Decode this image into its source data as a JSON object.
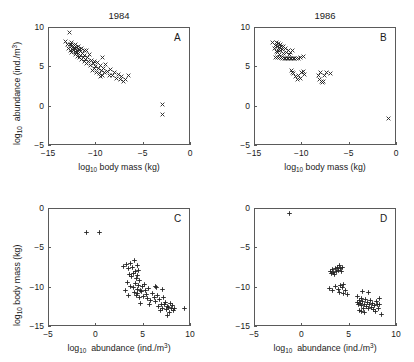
{
  "figure": {
    "width": 414,
    "height": 362,
    "background": "#ffffff",
    "marker_color": "#222222",
    "axis_color": "#5a5a5a"
  },
  "labels": {
    "body_mass_axis": "body mass (kg)",
    "abundance_axis": "abundance (ind./m",
    "log_prefix": "log",
    "log_sub": "10",
    "cube": "3",
    "close_paren": ")"
  },
  "chart_data": [
    {
      "type": "scatter",
      "panel": "A",
      "title": "1984",
      "xlabel": "log10 body mass (kg)",
      "ylabel": "log10 abundance (ind./m3)",
      "xlim": [
        -15,
        0
      ],
      "ylim": [
        -5,
        10
      ],
      "xticks": [
        -15,
        -10,
        -5,
        0
      ],
      "xticklabels": [
        "−15",
        "−10",
        "−5",
        "0"
      ],
      "yticks": [
        -5,
        0,
        5,
        10
      ],
      "yticklabels": [
        "−5",
        "0",
        "5",
        "10"
      ],
      "grid": false,
      "marker": "x",
      "points": [
        [
          -13.3,
          8.3
        ],
        [
          -13.0,
          7.9
        ],
        [
          -12.9,
          7.4
        ],
        [
          -12.8,
          9.4
        ],
        [
          -12.7,
          7.9
        ],
        [
          -12.7,
          7.2
        ],
        [
          -12.6,
          8.1
        ],
        [
          -12.6,
          7.6
        ],
        [
          -12.5,
          7.8
        ],
        [
          -12.5,
          7.3
        ],
        [
          -12.4,
          7.6
        ],
        [
          -12.4,
          7.1
        ],
        [
          -12.3,
          7.8
        ],
        [
          -12.3,
          7.4
        ],
        [
          -12.2,
          7.0
        ],
        [
          -12.2,
          6.6
        ],
        [
          -12.1,
          7.5
        ],
        [
          -12.1,
          6.9
        ],
        [
          -12.0,
          7.2
        ],
        [
          -12.0,
          6.4
        ],
        [
          -11.9,
          7.6
        ],
        [
          -11.9,
          6.8
        ],
        [
          -11.8,
          6.2
        ],
        [
          -11.7,
          7.0
        ],
        [
          -11.7,
          6.5
        ],
        [
          -11.6,
          7.4
        ],
        [
          -11.6,
          6.0
        ],
        [
          -11.5,
          6.7
        ],
        [
          -11.4,
          6.3
        ],
        [
          -11.3,
          7.1
        ],
        [
          -11.3,
          5.8
        ],
        [
          -11.2,
          6.5
        ],
        [
          -11.1,
          6.0
        ],
        [
          -11.0,
          7.2
        ],
        [
          -11.0,
          5.5
        ],
        [
          -10.9,
          6.2
        ],
        [
          -10.8,
          5.8
        ],
        [
          -10.7,
          6.6
        ],
        [
          -10.6,
          5.2
        ],
        [
          -10.5,
          5.9
        ],
        [
          -10.4,
          4.6
        ],
        [
          -10.3,
          5.5
        ],
        [
          -10.2,
          4.9
        ],
        [
          -10.1,
          5.1
        ],
        [
          -10.0,
          4.4
        ],
        [
          -9.9,
          5.6
        ],
        [
          -9.8,
          4.8
        ],
        [
          -9.7,
          4.2
        ],
        [
          -9.6,
          5.2
        ],
        [
          -9.5,
          4.6
        ],
        [
          -9.4,
          6.2
        ],
        [
          -9.3,
          4.0
        ],
        [
          -9.2,
          4.9
        ],
        [
          -9.1,
          4.3
        ],
        [
          -9.0,
          5.4
        ],
        [
          -8.8,
          4.5
        ],
        [
          -8.6,
          4.0
        ],
        [
          -8.5,
          4.7
        ],
        [
          -8.3,
          3.9
        ],
        [
          -8.1,
          4.3
        ],
        [
          -7.9,
          3.6
        ],
        [
          -7.7,
          4.1
        ],
        [
          -7.5,
          3.5
        ],
        [
          -7.3,
          3.8
        ],
        [
          -7.1,
          3.2
        ],
        [
          -6.9,
          3.4
        ],
        [
          -6.6,
          4.0
        ],
        [
          -12.6,
          6.9
        ],
        [
          -12.2,
          7.9
        ],
        [
          -11.8,
          7.3
        ],
        [
          -10.2,
          5.8
        ],
        [
          -9.6,
          3.8
        ],
        [
          -3.0,
          0.3
        ],
        [
          -3.0,
          -1.0
        ]
      ]
    },
    {
      "type": "scatter",
      "panel": "B",
      "title": "1986",
      "xlabel": "log10 body mass (kg)",
      "ylabel": "log10 abundance (ind./m3)",
      "xlim": [
        -15,
        0
      ],
      "ylim": [
        -5,
        10
      ],
      "xticks": [
        -15,
        -10,
        -5,
        0
      ],
      "xticklabels": [
        "−15",
        "−10",
        "−5",
        "0"
      ],
      "yticks": [
        -5,
        0,
        5,
        10
      ],
      "yticklabels": [
        "−5",
        "0",
        "5",
        "10"
      ],
      "grid": false,
      "marker": "x",
      "points": [
        [
          -13.1,
          8.1
        ],
        [
          -12.9,
          7.4
        ],
        [
          -12.8,
          7.8
        ],
        [
          -12.7,
          8.2
        ],
        [
          -12.7,
          7.0
        ],
        [
          -12.6,
          7.6
        ],
        [
          -12.6,
          6.9
        ],
        [
          -12.5,
          8.0
        ],
        [
          -12.5,
          7.2
        ],
        [
          -12.4,
          7.5
        ],
        [
          -12.4,
          6.6
        ],
        [
          -12.3,
          7.9
        ],
        [
          -12.3,
          7.1
        ],
        [
          -12.2,
          6.3
        ],
        [
          -12.2,
          7.7
        ],
        [
          -12.1,
          7.3
        ],
        [
          -12.1,
          6.1
        ],
        [
          -12.0,
          7.6
        ],
        [
          -12.0,
          6.8
        ],
        [
          -11.9,
          6.1
        ],
        [
          -11.8,
          7.4
        ],
        [
          -11.8,
          6.1
        ],
        [
          -11.7,
          6.9
        ],
        [
          -11.6,
          6.1
        ],
        [
          -11.5,
          7.2
        ],
        [
          -11.5,
          6.1
        ],
        [
          -11.4,
          6.6
        ],
        [
          -11.3,
          6.1
        ],
        [
          -11.2,
          6.9
        ],
        [
          -11.1,
          6.1
        ],
        [
          -11.0,
          7.1
        ],
        [
          -10.9,
          6.1
        ],
        [
          -10.8,
          6.1
        ],
        [
          -10.6,
          6.1
        ],
        [
          -10.4,
          6.1
        ],
        [
          -10.2,
          6.2
        ],
        [
          -9.9,
          6.4
        ],
        [
          -12.8,
          6.2
        ],
        [
          -12.6,
          6.2
        ],
        [
          -12.4,
          6.2
        ],
        [
          -12.2,
          6.2
        ],
        [
          -11.1,
          4.6
        ],
        [
          -11.0,
          4.4
        ],
        [
          -10.9,
          4.2
        ],
        [
          -10.7,
          3.8
        ],
        [
          -10.5,
          3.4
        ],
        [
          -10.4,
          4.0
        ],
        [
          -10.2,
          3.6
        ],
        [
          -10.1,
          4.3
        ],
        [
          -9.9,
          4.5
        ],
        [
          -9.8,
          4.1
        ],
        [
          -8.3,
          3.9
        ],
        [
          -8.2,
          3.4
        ],
        [
          -8.1,
          4.3
        ],
        [
          -8.0,
          3.2
        ],
        [
          -7.9,
          3.1
        ],
        [
          -7.8,
          3.2
        ],
        [
          -7.7,
          4.0
        ],
        [
          -7.4,
          4.4
        ],
        [
          -7.0,
          4.2
        ],
        [
          -0.9,
          -1.5
        ]
      ]
    },
    {
      "type": "scatter",
      "panel": "C",
      "title": "",
      "xlabel": "log10 abundance (ind./m3)",
      "ylabel": "log10 body mass (kg)",
      "xlim": [
        -5,
        10
      ],
      "ylim": [
        -15,
        0
      ],
      "xticks": [
        -5,
        0,
        5,
        10
      ],
      "xticklabels": [
        "−5",
        "0",
        "5",
        "10"
      ],
      "yticks": [
        -15,
        -10,
        -5,
        0
      ],
      "yticklabels": [
        "−15",
        "−10",
        "−5",
        "0"
      ],
      "grid": false,
      "marker": "+",
      "points": [
        [
          -1.0,
          -3.0
        ],
        [
          0.3,
          -3.0
        ],
        [
          2.9,
          -7.3
        ],
        [
          3.2,
          -7.0
        ],
        [
          3.4,
          -7.6
        ],
        [
          3.6,
          -6.9
        ],
        [
          3.8,
          -7.4
        ],
        [
          4.0,
          -6.6
        ],
        [
          4.1,
          -8.0
        ],
        [
          4.3,
          -7.2
        ],
        [
          3.5,
          -8.3
        ],
        [
          3.7,
          -8.6
        ],
        [
          3.9,
          -8.2
        ],
        [
          4.2,
          -8.8
        ],
        [
          4.4,
          -8.4
        ],
        [
          4.5,
          -7.8
        ],
        [
          4.6,
          -9.1
        ],
        [
          3.3,
          -9.4
        ],
        [
          3.6,
          -9.8
        ],
        [
          3.9,
          -10.0
        ],
        [
          4.1,
          -9.5
        ],
        [
          4.3,
          -10.2
        ],
        [
          4.5,
          -9.7
        ],
        [
          4.7,
          -10.4
        ],
        [
          4.9,
          -9.9
        ],
        [
          4.0,
          -10.6
        ],
        [
          4.2,
          -11.0
        ],
        [
          4.4,
          -10.8
        ],
        [
          4.6,
          -11.3
        ],
        [
          4.8,
          -10.5
        ],
        [
          5.0,
          -11.1
        ],
        [
          5.2,
          -10.3
        ],
        [
          5.4,
          -11.4
        ],
        [
          5.1,
          -9.6
        ],
        [
          5.3,
          -10.9
        ],
        [
          5.5,
          -10.1
        ],
        [
          5.7,
          -11.6
        ],
        [
          5.9,
          -10.7
        ],
        [
          6.1,
          -11.2
        ],
        [
          6.3,
          -11.8
        ],
        [
          6.5,
          -11.0
        ],
        [
          6.7,
          -11.5
        ],
        [
          6.9,
          -12.1
        ],
        [
          7.1,
          -11.3
        ],
        [
          7.3,
          -11.9
        ],
        [
          7.5,
          -12.4
        ],
        [
          7.0,
          -12.6
        ],
        [
          7.2,
          -12.2
        ],
        [
          7.4,
          -12.8
        ],
        [
          7.6,
          -12.5
        ],
        [
          7.8,
          -12.0
        ],
        [
          7.9,
          -12.7
        ],
        [
          8.0,
          -12.3
        ],
        [
          8.1,
          -12.9
        ],
        [
          7.7,
          -13.2
        ],
        [
          7.5,
          -13.5
        ],
        [
          8.3,
          -12.6
        ],
        [
          6.8,
          -12.9
        ],
        [
          6.6,
          -12.4
        ],
        [
          9.3,
          -12.6
        ],
        [
          6.4,
          -10.0
        ],
        [
          7.0,
          -10.2
        ],
        [
          6.2,
          -9.9
        ],
        [
          3.1,
          -10.3
        ],
        [
          3.4,
          -11.0
        ],
        [
          4.7,
          -12.0
        ],
        [
          5.6,
          -12.2
        ]
      ]
    },
    {
      "type": "scatter",
      "panel": "D",
      "title": "",
      "xlabel": "log10 abundance (ind./m3)",
      "ylabel": "log10 body mass (kg)",
      "xlim": [
        -5,
        10
      ],
      "ylim": [
        -15,
        0
      ],
      "xticks": [
        -5,
        0,
        5,
        10
      ],
      "xticklabels": [
        "−5",
        "0",
        "5",
        "10"
      ],
      "yticks": [
        -15,
        -10,
        -5,
        0
      ],
      "yticklabels": [
        "−15",
        "−10",
        "−5",
        "0"
      ],
      "grid": false,
      "marker": "+",
      "points": [
        [
          -1.4,
          -0.6
        ],
        [
          3.0,
          -7.9
        ],
        [
          3.2,
          -7.7
        ],
        [
          3.3,
          -8.1
        ],
        [
          3.5,
          -7.6
        ],
        [
          3.6,
          -8.0
        ],
        [
          3.7,
          -7.4
        ],
        [
          3.8,
          -7.8
        ],
        [
          3.9,
          -7.2
        ],
        [
          4.0,
          -7.6
        ],
        [
          4.2,
          -7.4
        ],
        [
          3.4,
          -8.3
        ],
        [
          3.1,
          -8.2
        ],
        [
          4.1,
          -8.0
        ],
        [
          2.9,
          -10.1
        ],
        [
          3.2,
          -10.3
        ],
        [
          3.5,
          -9.9
        ],
        [
          3.8,
          -10.2
        ],
        [
          4.0,
          -9.7
        ],
        [
          4.2,
          -10.0
        ],
        [
          4.4,
          -9.6
        ],
        [
          4.6,
          -10.4
        ],
        [
          4.8,
          -10.9
        ],
        [
          4.3,
          -10.7
        ],
        [
          3.9,
          -10.6
        ],
        [
          5.8,
          -11.1
        ],
        [
          6.0,
          -11.6
        ],
        [
          6.1,
          -12.0
        ],
        [
          6.2,
          -11.4
        ],
        [
          6.3,
          -12.3
        ],
        [
          6.4,
          -11.8
        ],
        [
          6.5,
          -12.6
        ],
        [
          6.6,
          -12.1
        ],
        [
          6.7,
          -11.5
        ],
        [
          6.8,
          -12.4
        ],
        [
          6.9,
          -11.9
        ],
        [
          7.0,
          -12.7
        ],
        [
          7.1,
          -12.2
        ],
        [
          7.2,
          -11.6
        ],
        [
          7.3,
          -12.5
        ],
        [
          7.4,
          -12.0
        ],
        [
          7.5,
          -12.8
        ],
        [
          7.6,
          -12.3
        ],
        [
          7.8,
          -11.8
        ],
        [
          8.0,
          -12.6
        ],
        [
          8.2,
          -12.1
        ],
        [
          8.4,
          -13.4
        ],
        [
          7.7,
          -13.0
        ],
        [
          6.0,
          -12.9
        ],
        [
          6.2,
          -13.0
        ],
        [
          5.9,
          -12.2
        ],
        [
          5.85,
          -11.9
        ],
        [
          7.9,
          -12.2
        ],
        [
          6.4,
          -10.5
        ],
        [
          7.0,
          -10.6
        ],
        [
          8.1,
          -11.4
        ],
        [
          6.6,
          -13.1
        ]
      ]
    }
  ]
}
